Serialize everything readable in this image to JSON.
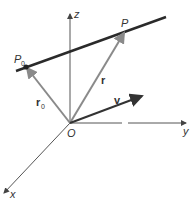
{
  "diagram": {
    "axes": {
      "z": {
        "label": "z"
      },
      "y": {
        "label": "y"
      },
      "x": {
        "label": "x"
      }
    },
    "points": {
      "origin": {
        "label": "O"
      },
      "p0": {
        "label": "P",
        "subscript": "0"
      },
      "p": {
        "label": "P"
      }
    },
    "vectors": {
      "r0": {
        "label": "r",
        "subscript": "0"
      },
      "r": {
        "label": "r"
      },
      "v": {
        "label": "v"
      }
    },
    "colors": {
      "line": "#2a2a2a",
      "position_vectors": "#8a8a8a",
      "axes": "#555555",
      "direction_vector": "#333333"
    }
  }
}
